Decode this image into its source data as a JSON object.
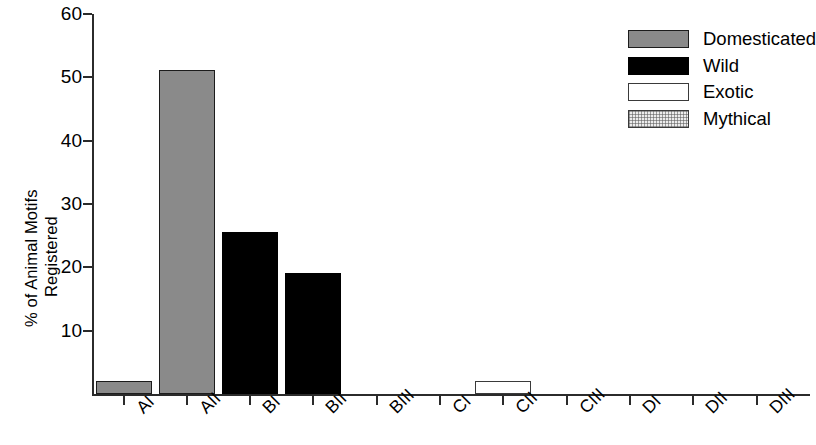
{
  "chart_data": {
    "type": "bar",
    "title": "",
    "xlabel": "",
    "ylabel_lines": [
      "% of Animal Motifs",
      "Registered"
    ],
    "ylabel": "% of Animal Motifs Registered",
    "categories": [
      "AI",
      "AII",
      "BI",
      "BII",
      "BIII",
      "CI",
      "CII",
      "CIII",
      "DI",
      "DII",
      "DIII"
    ],
    "values": [
      2,
      51.2,
      25.6,
      19.1,
      0,
      0,
      2,
      0,
      0,
      0,
      0
    ],
    "bar_categories": [
      {
        "label": "AI",
        "value": 2,
        "series": "Domesticated"
      },
      {
        "label": "AII",
        "value": 51.2,
        "series": "Domesticated"
      },
      {
        "label": "BI",
        "value": 25.6,
        "series": "Wild"
      },
      {
        "label": "BII",
        "value": 19.1,
        "series": "Wild"
      },
      {
        "label": "BIII",
        "value": 0,
        "series": "Wild"
      },
      {
        "label": "CI",
        "value": 0,
        "series": "Exotic"
      },
      {
        "label": "CII",
        "value": 2,
        "series": "Exotic"
      },
      {
        "label": "CIII",
        "value": 0,
        "series": "Exotic"
      },
      {
        "label": "DI",
        "value": 0,
        "series": "Mythical"
      },
      {
        "label": "DII",
        "value": 0,
        "series": "Mythical"
      },
      {
        "label": "DIII",
        "value": 0,
        "series": "Mythical"
      }
    ],
    "ylim": [
      0,
      60
    ],
    "yticks": [
      10,
      20,
      30,
      40,
      50,
      60
    ],
    "grid": false,
    "legend_position": "top-right",
    "legend": [
      {
        "label": "Domesticated",
        "fill": "domesticated",
        "color": "#8a8a8a"
      },
      {
        "label": "Wild",
        "fill": "wild",
        "color": "#000000"
      },
      {
        "label": "Exotic",
        "fill": "exotic",
        "color": "#ffffff"
      },
      {
        "label": "Mythical",
        "fill": "mythical",
        "color": "#e3e3e3"
      }
    ]
  }
}
